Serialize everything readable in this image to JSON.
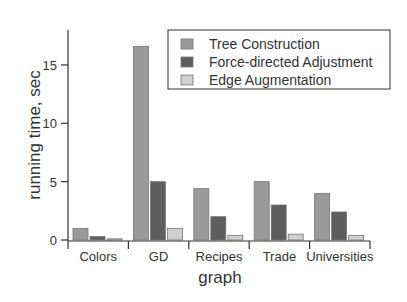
{
  "chart_data": {
    "type": "bar",
    "title": "",
    "xlabel": "graph",
    "ylabel": "running time, sec",
    "categories": [
      "Colors",
      "GD",
      "Recipes",
      "Trade",
      "Universities"
    ],
    "series": [
      {
        "name": "Tree Construction",
        "color": "#9a9a9a",
        "values": [
          1.0,
          16.6,
          4.4,
          5.0,
          4.0
        ]
      },
      {
        "name": "Force-directed Adjustment",
        "color": "#5e5e5e",
        "values": [
          0.3,
          5.0,
          2.0,
          3.0,
          2.4
        ]
      },
      {
        "name": "Edge Augmentation",
        "color": "#cfcfcf",
        "values": [
          0.1,
          1.0,
          0.4,
          0.5,
          0.4
        ]
      }
    ],
    "ylim": [
      0,
      17.5
    ],
    "yticks": [
      0,
      5,
      10,
      15
    ],
    "grid": false,
    "legend_position": "upper right"
  }
}
